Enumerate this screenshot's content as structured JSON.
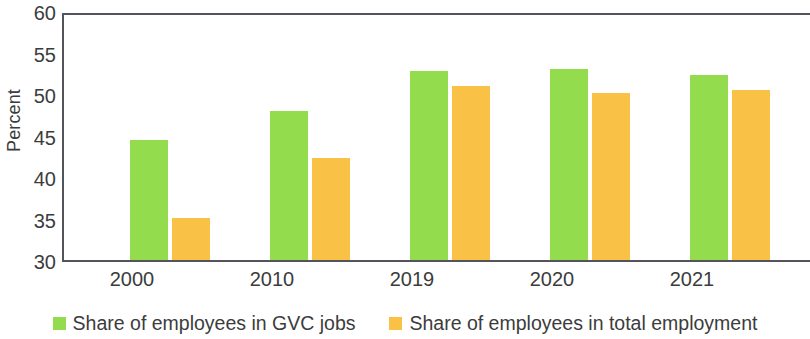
{
  "chart_data": {
    "type": "bar",
    "title": "",
    "xlabel": "",
    "ylabel": "Percent",
    "categories": [
      "2000",
      "2010",
      "2019",
      "2020",
      "2021"
    ],
    "ylim": [
      30,
      60
    ],
    "yticks": [
      30,
      35,
      40,
      45,
      50,
      55,
      60
    ],
    "ytick_labels": [
      "30",
      "35",
      "40",
      "45",
      "50",
      "55",
      "60"
    ],
    "grid": false,
    "legend_position": "bottom",
    "series": [
      {
        "name": "Share of employees in GVC jobs",
        "color": "#92dc4e",
        "values": [
          44.7,
          48.2,
          53.1,
          53.4,
          52.6
        ]
      },
      {
        "name": "Share of employees in total employment",
        "color": "#f9c247",
        "values": [
          35.1,
          42.5,
          51.3,
          50.5,
          50.8
        ]
      }
    ]
  },
  "axis": {
    "y_title": "Percent"
  },
  "legend": {
    "items": [
      {
        "label": "Share of employees in GVC jobs",
        "color": "#92dc4e"
      },
      {
        "label": "Share of employees in total employment",
        "color": "#f9c247"
      }
    ]
  }
}
